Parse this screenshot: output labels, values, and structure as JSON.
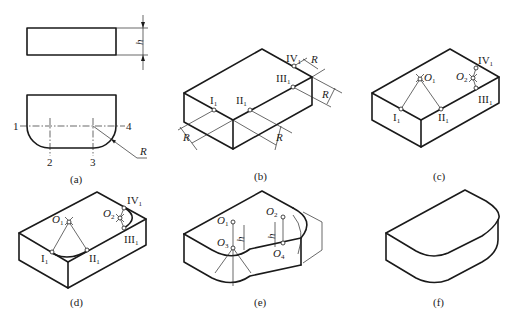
{
  "figure": {
    "panels": [
      {
        "id": "a",
        "caption": "(a)",
        "labels": {
          "dim_height": "h",
          "radius": "R",
          "c1": "1",
          "c2": "2",
          "c3": "3",
          "c4": "4"
        }
      },
      {
        "id": "b",
        "caption": "(b)",
        "labels": {
          "p1": "I",
          "p2": "II",
          "p3": "III",
          "p4": "IV",
          "sub": "1",
          "radius": "R"
        }
      },
      {
        "id": "c",
        "caption": "(c)",
        "labels": {
          "p1": "I",
          "p2": "II",
          "p3": "III",
          "p4": "IV",
          "sub": "1",
          "o1": "O",
          "o1_sub": "1",
          "o2": "O",
          "o2_sub": "2"
        }
      },
      {
        "id": "d",
        "caption": "(d)",
        "labels": {
          "p1": "I",
          "p2": "II",
          "p3": "III",
          "p4": "IV",
          "sub": "1",
          "o1": "O",
          "o1_sub": "1",
          "o2": "O",
          "o2_sub": "2"
        }
      },
      {
        "id": "e",
        "caption": "(e)",
        "labels": {
          "o1": "O",
          "o1_sub": "1",
          "o2": "O",
          "o2_sub": "2",
          "o3": "O",
          "o3_sub": "3",
          "o4": "O",
          "o4_sub": "4",
          "dim_height": "h"
        }
      },
      {
        "id": "f",
        "caption": "(f)"
      }
    ],
    "colors": {
      "line": "#1a1a1a",
      "background": "#ffffff"
    }
  }
}
